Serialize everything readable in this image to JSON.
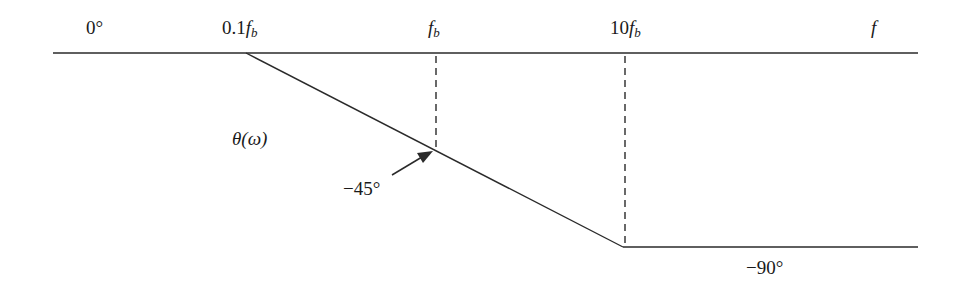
{
  "diagram": {
    "type": "bode-phase-asymptote",
    "labels": {
      "zero_deg": "0°",
      "tenth_fb_coef": "0.1",
      "fb_f": "f",
      "fb_sub": "b",
      "ten_fb_coef": "10",
      "f_axis": "f",
      "theta": "θ(ω)",
      "minus45": "−45°",
      "minus90": "−90°"
    },
    "colors": {
      "line": "#2a2a2a",
      "text": "#1a1a1a",
      "background": "#ffffff"
    },
    "geometry": {
      "top_line": {
        "x1": 53,
        "x2": 918,
        "y": 53
      },
      "slope": {
        "x1": 246,
        "y1": 53,
        "x2": 623,
        "y2": 247
      },
      "bottom_line": {
        "x1": 623,
        "x2": 918,
        "y": 247
      },
      "dashed_fb": {
        "x": 436,
        "y1": 56,
        "y2": 150
      },
      "dashed_10fb": {
        "x": 625,
        "y1": 56,
        "y2": 246
      },
      "arrow": {
        "x1": 393,
        "y1": 174,
        "x2": 432,
        "y2": 152
      }
    }
  }
}
